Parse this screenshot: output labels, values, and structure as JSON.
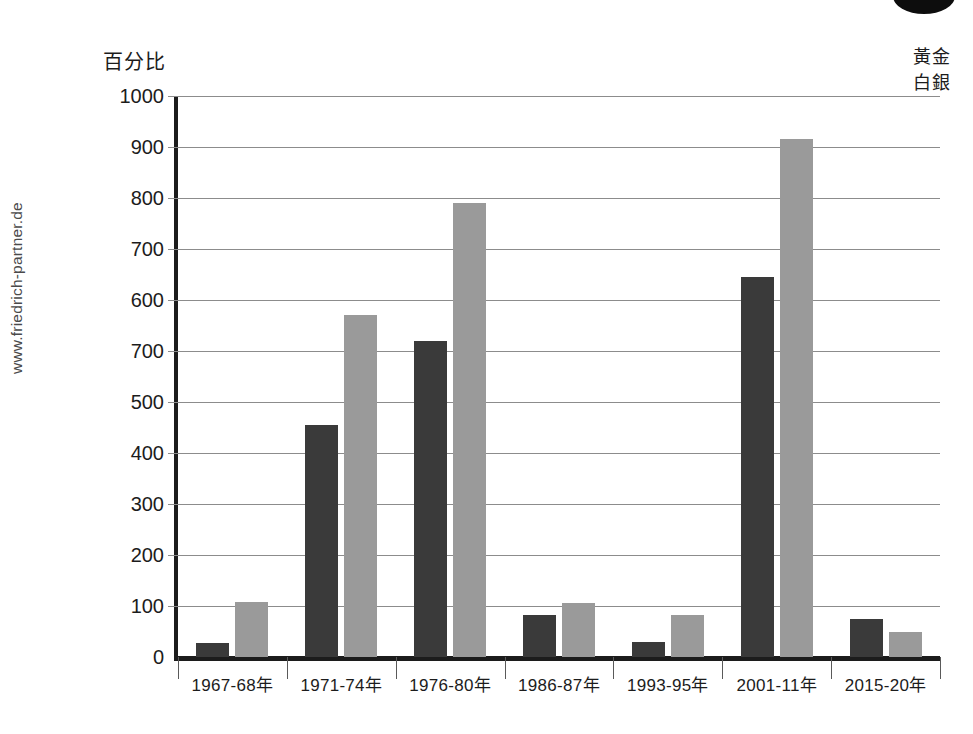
{
  "watermark": "www.friedrich-partner.de",
  "axis_title": "百分比",
  "legend": {
    "gold": "黃金",
    "silver": "白銀"
  },
  "colors": {
    "gold": "#3a3a3a",
    "silver": "#9a9a9a",
    "axis": "#1c1c1c",
    "grid": "#8c8c8c",
    "background": "#ffffff"
  },
  "chart_data": {
    "type": "bar",
    "title": "",
    "xlabel": "",
    "ylabel": "百分比",
    "ylim": [
      0,
      1050
    ],
    "grid": true,
    "legend_position": "top-right",
    "categories": [
      "1967-68年",
      "1971-74年",
      "1976-80年",
      "1986-87年",
      "1993-95年",
      "2001-11年",
      "2015-20年"
    ],
    "y_tick_labels": [
      "1000",
      "900",
      "800",
      "700",
      "600",
      "700",
      "500",
      "400",
      "300",
      "200",
      "100",
      "0"
    ],
    "y_tick_values": [
      1000,
      900,
      800,
      700,
      600,
      550,
      500,
      400,
      300,
      200,
      100,
      0
    ],
    "note": "The sixth y-axis tick is printed as 700 in the original where 600 would be expected; reproduced as shown.",
    "series": [
      {
        "name": "黃金",
        "color": "#3a3a3a",
        "values": [
          28,
          455,
          620,
          82,
          30,
          745,
          75
        ]
      },
      {
        "name": "白銀",
        "color": "#9a9a9a",
        "values": [
          108,
          670,
          890,
          105,
          83,
          1015,
          50
        ]
      }
    ]
  }
}
